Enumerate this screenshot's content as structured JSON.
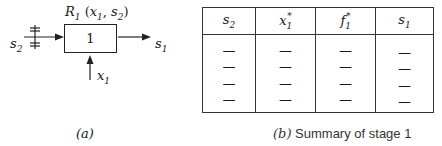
{
  "diagram": {
    "stage_label": "1",
    "return_label": {
      "main": "R",
      "sub": "1",
      "args": "(x",
      "args_sub": "1",
      "args_mid": ", s",
      "args_sub2": "2",
      "args_end": ")"
    },
    "input_state": {
      "main": "s",
      "sub": "2"
    },
    "output_state": {
      "main": "s",
      "sub": "1"
    },
    "decision": {
      "main": "x",
      "sub": "1"
    },
    "caption": "(a)"
  },
  "table": {
    "headers": [
      {
        "main": "s",
        "sub": "2",
        "sup": ""
      },
      {
        "main": "x",
        "sub": "1",
        "sup": "*"
      },
      {
        "main": "f",
        "sub": "1",
        "sup": "*"
      },
      {
        "main": "s",
        "sub": "1",
        "sup": ""
      }
    ],
    "rows": [
      [
        "—",
        "—",
        "—",
        "—"
      ],
      [
        "—",
        "—",
        "—",
        "—"
      ],
      [
        "—",
        "—",
        "—",
        "—"
      ],
      [
        "—",
        "—",
        "—",
        "—"
      ]
    ],
    "caption_letter": "(b)",
    "caption_text": " Summary of stage 1"
  }
}
